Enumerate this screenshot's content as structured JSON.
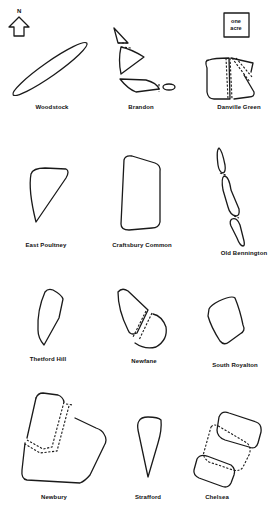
{
  "legend": {
    "north_label": "N",
    "scale_box_line1": "one",
    "scale_box_line2": "acre"
  },
  "commons": [
    {
      "name": "Woodstock"
    },
    {
      "name": "Brandon"
    },
    {
      "name": "Danville Green"
    },
    {
      "name": "East Poultney"
    },
    {
      "name": "Craftsbury Common"
    },
    {
      "name": "Old Bennington"
    },
    {
      "name": "Thetford Hill"
    },
    {
      "name": "Newfane"
    },
    {
      "name": "South Royalton"
    },
    {
      "name": "Newbury"
    },
    {
      "name": "Strafford"
    },
    {
      "name": "Chelsea"
    }
  ]
}
